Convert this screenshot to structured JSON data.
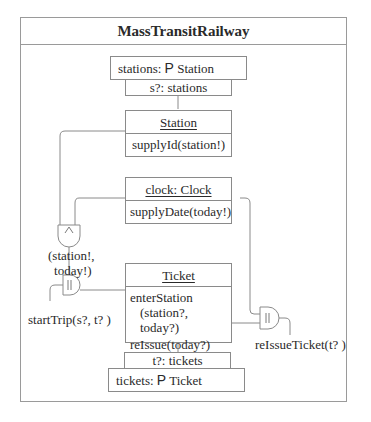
{
  "diagram": {
    "title": "MassTransitRailway",
    "stations_set": {
      "prefix": "stations: ",
      "symbol": "P",
      "type": " Station"
    },
    "station_selector": "s?: stations",
    "station_class": {
      "name": "Station",
      "operation": "supplyId(station!)"
    },
    "clock_object": {
      "name": "clock: Clock",
      "operation": "supplyDate(today!)"
    },
    "and_gate": {
      "symbol": "∧",
      "output_label_line1": "(station!,",
      "output_label_line2": "today!)"
    },
    "parallel_gate_left": {
      "symbol": "||",
      "label": "startTrip(s?, t? )"
    },
    "parallel_gate_right": {
      "symbol": "||",
      "label": "reIssueTicket(t? )"
    },
    "ticket_class": {
      "name": "Ticket",
      "operation1_line1": "enterStation",
      "operation1_line2": "(station?, today?)",
      "operation2": "reIssue(today?)"
    },
    "ticket_selector": "t?: tickets",
    "tickets_set": {
      "prefix": "tickets: ",
      "symbol": "P",
      "type": " Ticket"
    },
    "colors": {
      "line": "#8a8a8a",
      "text": "#2a2a2a",
      "background": "#ffffff"
    }
  }
}
